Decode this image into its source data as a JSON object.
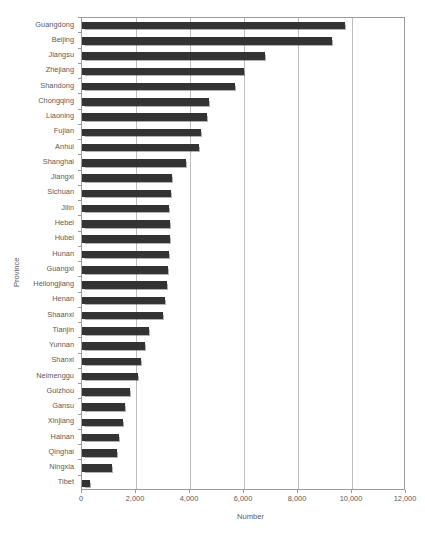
{
  "chart_data": {
    "type": "bar",
    "orientation": "horizontal",
    "title": "",
    "xlabel": "Number",
    "ylabel": "Province",
    "xlim": [
      0,
      12000
    ],
    "xticks": [
      0,
      2000,
      4000,
      6000,
      8000,
      10000,
      12000
    ],
    "xtick_labels": [
      "0",
      "2,000",
      "4,000",
      "6,000",
      "8,000",
      "10,000",
      "12,000"
    ],
    "grid": "vertical",
    "legend": "none",
    "bar_color": "#333333",
    "categories": [
      "Guangdong",
      "Beijing",
      "Jiangsu",
      "Zhejiang",
      "Shandong",
      "Chongqing",
      "Liaoning",
      "Fujian",
      "Anhui",
      "Shanghai",
      "Jiangxi",
      "Sichuan",
      "Jilin",
      "Hebei",
      "Hubei",
      "Hunan",
      "Guangxi",
      "Heilongjiang",
      "Henan",
      "Shaanxi",
      "Tianjin",
      "Yunnan",
      "Shanxi",
      "Neimenggu",
      "Guizhou",
      "Gansu",
      "Xinjiang",
      "Hainan",
      "Qinghai",
      "Ningxia",
      "Tibet"
    ],
    "values": [
      9740,
      9260,
      6780,
      6000,
      5670,
      4700,
      4630,
      4410,
      4330,
      3850,
      3330,
      3300,
      3220,
      3260,
      3260,
      3240,
      3180,
      3150,
      3070,
      3000,
      2480,
      2330,
      2190,
      2070,
      1780,
      1590,
      1520,
      1370,
      1300,
      1110,
      300
    ]
  },
  "axes": {
    "x_title": "Number",
    "y_title": "Province"
  },
  "header": {
    "cropped_text": ""
  }
}
